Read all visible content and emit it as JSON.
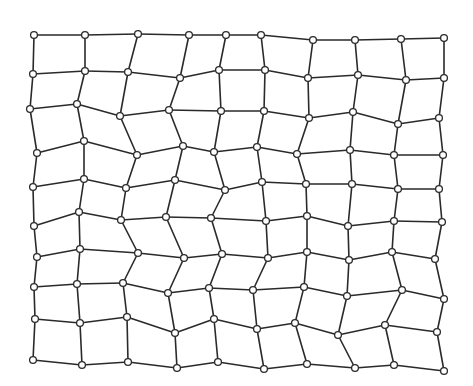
{
  "diagram": {
    "type": "deformed-grid-mesh",
    "rows": 10,
    "cols": 10,
    "colors": {
      "background": "#ffffff",
      "line": "#2a2a2a",
      "node_fill": "#ffffff",
      "node_stroke": "#2a2a2a"
    },
    "node_radius": 3.4,
    "nodes": [
      [
        [
          34,
          35
        ],
        [
          85,
          35
        ],
        [
          138,
          34
        ],
        [
          189,
          35
        ],
        [
          226,
          35
        ],
        [
          261,
          35
        ],
        [
          313,
          40
        ],
        [
          355,
          40
        ],
        [
          401,
          39
        ],
        [
          444,
          38
        ]
      ],
      [
        [
          33,
          74
        ],
        [
          85,
          71
        ],
        [
          128,
          72
        ],
        [
          180,
          78
        ],
        [
          219,
          70
        ],
        [
          265,
          70
        ],
        [
          308,
          78
        ],
        [
          358,
          75
        ],
        [
          406,
          80
        ],
        [
          444,
          78
        ]
      ],
      [
        [
          30,
          109
        ],
        [
          77,
          104
        ],
        [
          120,
          116
        ],
        [
          169,
          110
        ],
        [
          221,
          111
        ],
        [
          264,
          111
        ],
        [
          309,
          118
        ],
        [
          353,
          112
        ],
        [
          398,
          124
        ],
        [
          439,
          118
        ]
      ],
      [
        [
          37,
          153
        ],
        [
          84,
          141
        ],
        [
          137,
          155
        ],
        [
          183,
          146
        ],
        [
          214,
          152
        ],
        [
          257,
          147
        ],
        [
          297,
          154
        ],
        [
          350,
          150
        ],
        [
          394,
          155
        ],
        [
          443,
          155
        ]
      ],
      [
        [
          33,
          187
        ],
        [
          84,
          179
        ],
        [
          126,
          188
        ],
        [
          175,
          180
        ],
        [
          225,
          190
        ],
        [
          262,
          182
        ],
        [
          306,
          184
        ],
        [
          352,
          184
        ],
        [
          398,
          189
        ],
        [
          439,
          189
        ]
      ],
      [
        [
          34,
          226
        ],
        [
          79,
          212
        ],
        [
          121,
          220
        ],
        [
          166,
          217
        ],
        [
          211,
          218
        ],
        [
          266,
          221
        ],
        [
          307,
          216
        ],
        [
          348,
          226
        ],
        [
          394,
          221
        ],
        [
          442,
          222
        ]
      ],
      [
        [
          37,
          257
        ],
        [
          80,
          249
        ],
        [
          138,
          253
        ],
        [
          184,
          258
        ],
        [
          222,
          254
        ],
        [
          268,
          258
        ],
        [
          307,
          252
        ],
        [
          349,
          260
        ],
        [
          392,
          252
        ],
        [
          435,
          259
        ]
      ],
      [
        [
          34,
          287
        ],
        [
          77,
          284
        ],
        [
          123,
          283
        ],
        [
          168,
          293
        ],
        [
          209,
          288
        ],
        [
          253,
          290
        ],
        [
          304,
          287
        ],
        [
          347,
          296
        ],
        [
          402,
          290
        ],
        [
          444,
          299
        ]
      ],
      [
        [
          35,
          319
        ],
        [
          80,
          323
        ],
        [
          127,
          317
        ],
        [
          175,
          333
        ],
        [
          214,
          319
        ],
        [
          257,
          329
        ],
        [
          295,
          323
        ],
        [
          338,
          335
        ],
        [
          385,
          325
        ],
        [
          437,
          332
        ]
      ],
      [
        [
          33,
          360
        ],
        [
          82,
          365
        ],
        [
          128,
          362
        ],
        [
          177,
          368
        ],
        [
          218,
          362
        ],
        [
          264,
          369
        ],
        [
          307,
          364
        ],
        [
          355,
          368
        ],
        [
          394,
          365
        ],
        [
          444,
          371
        ]
      ]
    ]
  }
}
